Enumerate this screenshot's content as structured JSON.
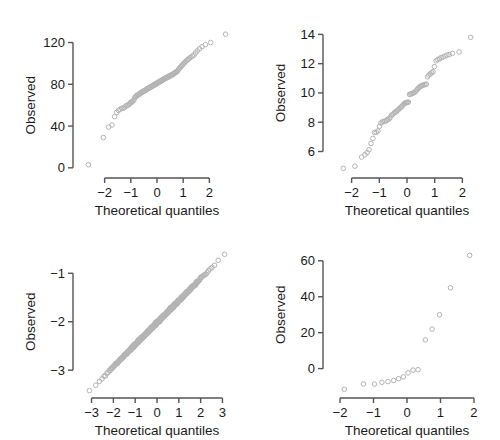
{
  "figure": {
    "title": "",
    "panel_count": 4,
    "background_color": "#ffffff",
    "point_color": "#b4b4b4",
    "axis_color": "#555555",
    "text_color": "#1a1a1a"
  },
  "labels": {
    "xlabel": "Theoretical quantiles",
    "ylabel": "Observed"
  },
  "chart_data": [
    {
      "type": "scatter",
      "title": "",
      "subtitle": "",
      "xlabel": "Theoretical quantiles",
      "ylabel": "Observed",
      "xlim": [
        -2.75,
        2.75
      ],
      "ylim": [
        -4,
        132
      ],
      "xticks": [
        -2,
        -1,
        0,
        1,
        2
      ],
      "xticklabels": [
        "-2",
        "-1",
        "0",
        "1",
        "2"
      ],
      "yticks": [
        0,
        40,
        80,
        120
      ],
      "yticklabels": [
        "0",
        "40",
        "80",
        "120"
      ],
      "grid": false,
      "legend": false,
      "marker": "open-circle",
      "x": [
        -2.62,
        -2.05,
        -1.85,
        -1.72,
        -1.62,
        -1.54,
        -1.47,
        -1.41,
        -1.35,
        -1.29,
        -1.24,
        -1.19,
        -1.15,
        -1.1,
        -1.06,
        -1.02,
        -0.99,
        -0.95,
        -0.92,
        -0.88,
        -0.85,
        -0.82,
        -0.79,
        -0.76,
        -0.73,
        -0.7,
        -0.67,
        -0.64,
        -0.62,
        -0.59,
        -0.56,
        -0.54,
        -0.51,
        -0.49,
        -0.46,
        -0.44,
        -0.41,
        -0.39,
        -0.36,
        -0.34,
        -0.32,
        -0.29,
        -0.27,
        -0.25,
        -0.22,
        -0.2,
        -0.18,
        -0.16,
        -0.13,
        -0.11,
        -0.09,
        -0.07,
        -0.04,
        -0.02,
        0.0,
        0.02,
        0.04,
        0.07,
        0.09,
        0.11,
        0.13,
        0.16,
        0.18,
        0.2,
        0.22,
        0.25,
        0.27,
        0.29,
        0.32,
        0.34,
        0.36,
        0.39,
        0.41,
        0.44,
        0.46,
        0.49,
        0.51,
        0.54,
        0.56,
        0.59,
        0.62,
        0.64,
        0.67,
        0.7,
        0.73,
        0.76,
        0.79,
        0.82,
        0.85,
        0.88,
        0.92,
        0.95,
        0.99,
        1.02,
        1.06,
        1.1,
        1.15,
        1.19,
        1.24,
        1.29,
        1.35,
        1.41,
        1.47,
        1.54,
        1.62,
        1.72,
        1.85,
        2.05,
        2.62
      ],
      "y": [
        3,
        29,
        39,
        41,
        49,
        53,
        55,
        56,
        57,
        57,
        58,
        59,
        60,
        60,
        61,
        62,
        63,
        63,
        64,
        65,
        67,
        68,
        69,
        69,
        70,
        70,
        71,
        71,
        72,
        72,
        73,
        73,
        73,
        74,
        74,
        74,
        75,
        75,
        76,
        76,
        76,
        77,
        77,
        77,
        78,
        78,
        78,
        79,
        79,
        79,
        80,
        80,
        80,
        81,
        81,
        81,
        82,
        82,
        82,
        83,
        83,
        83,
        84,
        84,
        84,
        85,
        85,
        85,
        86,
        86,
        86,
        87,
        87,
        87,
        88,
        88,
        88,
        89,
        89,
        89,
        90,
        90,
        91,
        91,
        92,
        92,
        93,
        94,
        95,
        96,
        97,
        98,
        99,
        100,
        101,
        102,
        103,
        104,
        105,
        106,
        107,
        108,
        110,
        112,
        114,
        116,
        118,
        120,
        128
      ]
    },
    {
      "type": "scatter",
      "title": "",
      "subtitle": "",
      "xlabel": "Theoretical quantiles",
      "ylabel": "Observed",
      "xlim": [
        -2.6,
        2.6
      ],
      "ylim": [
        4.6,
        14.3
      ],
      "xticks": [
        -2,
        -1,
        0,
        1,
        2
      ],
      "xticklabels": [
        "-2",
        "-1",
        "0",
        "1",
        "2"
      ],
      "yticks": [
        6,
        8,
        10,
        12,
        14
      ],
      "yticklabels": [
        "6",
        "8",
        "10",
        "12",
        "14"
      ],
      "grid": false,
      "legend": false,
      "marker": "open-circle",
      "x": [
        -2.3,
        -1.88,
        -1.64,
        -1.52,
        -1.44,
        -1.37,
        -1.3,
        -1.23,
        -1.17,
        -1.11,
        -1.05,
        -0.99,
        -0.94,
        -0.89,
        -0.84,
        -0.79,
        -0.74,
        -0.7,
        -0.65,
        -0.61,
        -0.56,
        -0.52,
        -0.48,
        -0.44,
        -0.4,
        -0.36,
        -0.32,
        -0.28,
        -0.24,
        -0.2,
        -0.17,
        -0.13,
        -0.09,
        -0.05,
        -0.02,
        0.02,
        0.05,
        0.09,
        0.13,
        0.17,
        0.2,
        0.24,
        0.28,
        0.32,
        0.36,
        0.4,
        0.44,
        0.48,
        0.52,
        0.56,
        0.61,
        0.65,
        0.7,
        0.74,
        0.79,
        0.84,
        0.89,
        0.94,
        0.99,
        1.05,
        1.11,
        1.17,
        1.23,
        1.3,
        1.37,
        1.44,
        1.52,
        1.64,
        1.88,
        2.3
      ],
      "y": [
        4.85,
        5.0,
        5.62,
        5.78,
        5.92,
        6.12,
        6.55,
        6.9,
        7.3,
        7.32,
        7.4,
        7.72,
        7.95,
        8.02,
        8.05,
        8.08,
        8.12,
        8.2,
        8.22,
        8.32,
        8.48,
        8.52,
        8.6,
        8.68,
        8.7,
        8.78,
        8.85,
        8.92,
        9.0,
        9.05,
        9.12,
        9.22,
        9.28,
        9.32,
        9.35,
        9.35,
        9.38,
        9.9,
        9.92,
        9.95,
        9.98,
        10.0,
        10.05,
        10.12,
        10.22,
        10.32,
        10.38,
        10.45,
        10.48,
        10.52,
        10.55,
        10.58,
        10.6,
        11.1,
        11.22,
        11.3,
        11.38,
        11.45,
        11.8,
        12.2,
        12.28,
        12.32,
        12.42,
        12.45,
        12.52,
        12.58,
        12.62,
        12.7,
        12.8,
        13.8
      ]
    },
    {
      "type": "scatter",
      "title": "",
      "subtitle": "",
      "xlabel": "Theoretical quantiles",
      "ylabel": "Observed",
      "xlim": [
        -3.3,
        3.3
      ],
      "ylim": [
        -3.45,
        -0.52
      ],
      "xticks": [
        -3,
        -2,
        -1,
        0,
        1,
        2,
        3
      ],
      "xticklabels": [
        "-3",
        "-2",
        "-1",
        "0",
        "1",
        "2",
        "3"
      ],
      "yticks": [
        -3,
        -2,
        -1
      ],
      "yticklabels": [
        "-3",
        "-2",
        "-1"
      ],
      "grid": false,
      "legend": false,
      "marker": "open-circle",
      "note": "Very dense sample (n approx 600) forming a near-continuous band; linear with slight tail deviation",
      "n_points": 600,
      "fit_slope": 0.47,
      "fit_intercept": -2.0,
      "x_min": -3.1,
      "x_max": 3.1,
      "y_at_xmin": -3.42,
      "y_at_xmax": -0.62
    },
    {
      "type": "scatter",
      "title": "",
      "subtitle": "",
      "xlabel": "Theoretical quantiles",
      "ylabel": "Observed",
      "xlim": [
        -2.15,
        2.15
      ],
      "ylim": [
        -13,
        66
      ],
      "xticks": [
        -2,
        -1,
        0,
        1,
        2
      ],
      "xticklabels": [
        "-2",
        "-1",
        "0",
        "1",
        "2"
      ],
      "yticks": [
        0,
        20,
        40,
        60
      ],
      "yticklabels": [
        "0",
        "20",
        "40",
        "60"
      ],
      "grid": false,
      "legend": false,
      "marker": "open-circle",
      "x": [
        -1.87,
        -1.3,
        -0.97,
        -0.75,
        -0.57,
        -0.4,
        -0.25,
        -0.11,
        0.03,
        0.18,
        0.33,
        0.55,
        0.75,
        0.97,
        1.3,
        1.87
      ],
      "y": [
        -11.5,
        -8.5,
        -8.6,
        -7.6,
        -7.2,
        -6.6,
        -5.6,
        -4.6,
        -2.4,
        -0.8,
        -0.6,
        16.0,
        22.0,
        30.0,
        45.0,
        63.0
      ]
    }
  ]
}
